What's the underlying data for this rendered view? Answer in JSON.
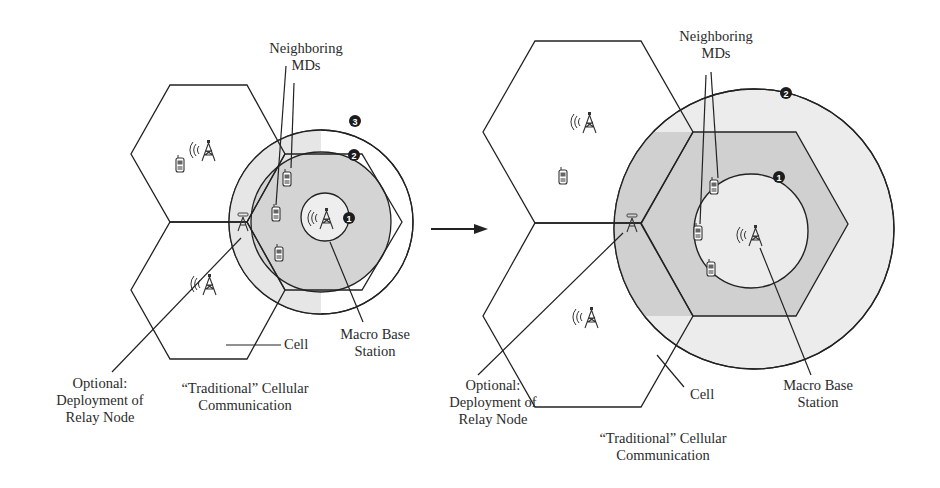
{
  "colors": {
    "stroke": "#222222",
    "zone_dark": "#cdcdcd",
    "zone_light": "#ececec",
    "zone_inner": "#e9e9e9",
    "text": "#2b2b2b",
    "background": "#ffffff"
  },
  "transition_arrow": {
    "icon": "right-arrow-icon"
  },
  "left_panel": {
    "neighboring_label": "Neighboring\nMDs",
    "cell_label": "Cell",
    "macro_label": "Macro Base\nStation",
    "relay_label": "Optional:\nDeployment of\nRelay Node",
    "traditional_label": "“Traditional” Cellular\nCommunication",
    "markers": [
      "1",
      "2",
      "3"
    ]
  },
  "right_panel": {
    "neighboring_label": "Neighboring\nMDs",
    "cell_label": "Cell",
    "macro_label": "Macro Base\nStation",
    "relay_label": "Optional:\nDeployment of\nRelay Node",
    "traditional_label": "“Traditional” Cellular\nCommunication",
    "markers": [
      "1",
      "2"
    ]
  },
  "icons": {
    "tower": "cell-tower-icon",
    "phone": "mobile-device-icon",
    "relay": "relay-node-icon",
    "marker": "numbered-marker-icon"
  }
}
